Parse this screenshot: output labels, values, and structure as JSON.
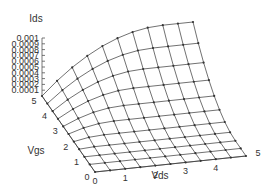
{
  "chart_data": {
    "type": "surface3d",
    "title": "",
    "zlabel": "Ids",
    "xlabel": "Vds",
    "ylabel": "Vgs",
    "x_ticks": [
      "0",
      "1",
      "2",
      "3",
      "4",
      "5"
    ],
    "y_ticks": [
      "0",
      "1",
      "2",
      "3",
      "4",
      "5"
    ],
    "z_ticks": [
      "0",
      "0.0001",
      "0.0002",
      "0.0003",
      "0.0004",
      "0.0005",
      "0.0006",
      "0.0007",
      "0.0008",
      "0.0009",
      "0.001"
    ],
    "xlim": [
      0,
      5
    ],
    "ylim": [
      0,
      5
    ],
    "zlim": [
      0,
      0.001
    ],
    "vds": [
      0,
      0.5,
      1,
      1.5,
      2,
      2.5,
      3,
      3.5,
      4,
      4.5,
      5
    ],
    "vgs": [
      0,
      0.5,
      1,
      1.5,
      2,
      2.5,
      3,
      3.5,
      4,
      4.5,
      5
    ],
    "ids": [
      [
        0,
        0,
        0,
        0,
        0,
        0,
        0,
        0,
        0,
        0,
        0
      ],
      [
        0,
        0,
        0,
        0,
        0,
        0,
        0,
        0,
        0,
        0,
        0
      ],
      [
        0,
        0,
        0,
        0,
        0,
        0,
        0,
        0,
        0,
        0,
        0
      ],
      [
        0,
        1.56e-05,
        1.56e-05,
        1.56e-05,
        1.56e-05,
        1.56e-05,
        1.56e-05,
        1.56e-05,
        1.56e-05,
        1.56e-05,
        1.56e-05
      ],
      [
        0,
        4.69e-05,
        6.25e-05,
        6.25e-05,
        6.25e-05,
        6.25e-05,
        6.25e-05,
        6.25e-05,
        6.25e-05,
        6.25e-05,
        6.25e-05
      ],
      [
        0,
        7.81e-05,
        0.000125,
        0.0001406,
        0.0001406,
        0.0001406,
        0.0001406,
        0.0001406,
        0.0001406,
        0.0001406,
        0.0001406
      ],
      [
        0,
        0.0001094,
        0.0001875,
        0.0002344,
        0.00025,
        0.00025,
        0.00025,
        0.00025,
        0.00025,
        0.00025,
        0.00025
      ],
      [
        0,
        0.0001406,
        0.00025,
        0.0003281,
        0.000375,
        0.0003906,
        0.0003906,
        0.0003906,
        0.0003906,
        0.0003906,
        0.0003906
      ],
      [
        0,
        0.0001719,
        0.0003125,
        0.0004219,
        0.0005,
        0.0005469,
        0.0005625,
        0.0005625,
        0.0005625,
        0.0005625,
        0.0005625
      ],
      [
        0,
        0.0002031,
        0.000375,
        0.0005156,
        0.000625,
        0.0007031,
        0.00075,
        0.0007656,
        0.0007656,
        0.0007656,
        0.0007656
      ],
      [
        0,
        0.0002344,
        0.0004375,
        0.0006094,
        0.00075,
        0.0008594,
        0.0009375,
        0.0009844,
        0.001,
        0.001,
        0.001
      ]
    ],
    "grid": false,
    "legend": null
  },
  "colors": {
    "line": "#333333",
    "marker": "#333333",
    "axis": "#555555"
  }
}
